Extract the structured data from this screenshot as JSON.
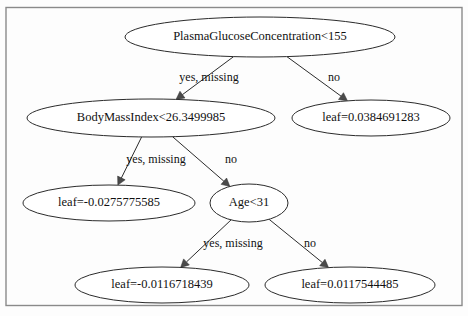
{
  "diagram": {
    "type": "decision-tree",
    "title": "",
    "frame_color": "#8a8a8a",
    "node_stroke_color": "#2b2b2b",
    "background_color": "#fdfdfd",
    "nodes": [
      {
        "id": "n0",
        "label": "PlasmaGlucoseConcentration<155",
        "kind": "split",
        "cx": 260,
        "cy": 37,
        "rx": 135,
        "ry": 20
      },
      {
        "id": "n1",
        "label": "BodyMassIndex<26.3499985",
        "kind": "split",
        "cx": 151,
        "cy": 118,
        "rx": 124,
        "ry": 19
      },
      {
        "id": "n2",
        "label": "leaf=0.0384691283",
        "kind": "leaf",
        "cx": 371,
        "cy": 118,
        "rx": 79,
        "ry": 18
      },
      {
        "id": "n3",
        "label": "leaf=-0.0275775585",
        "kind": "leaf",
        "cx": 109,
        "cy": 203,
        "rx": 86,
        "ry": 18
      },
      {
        "id": "n4",
        "label": "Age<31",
        "kind": "split",
        "cx": 249,
        "cy": 203,
        "rx": 39,
        "ry": 19
      },
      {
        "id": "n5",
        "label": "leaf=-0.0116718439",
        "kind": "leaf",
        "cx": 162,
        "cy": 285,
        "rx": 87,
        "ry": 18
      },
      {
        "id": "n6",
        "label": "leaf=0.0117544485",
        "kind": "leaf",
        "cx": 350,
        "cy": 285,
        "rx": 85,
        "ry": 18
      }
    ],
    "edges": [
      {
        "id": "e0",
        "from": "n0",
        "to": "n1",
        "label": "yes, missing",
        "label_x": 209,
        "label_y": 78
      },
      {
        "id": "e1",
        "from": "n0",
        "to": "n2",
        "label": "no",
        "label_x": 334,
        "label_y": 78
      },
      {
        "id": "e2",
        "from": "n1",
        "to": "n3",
        "label": "yes, missing",
        "label_x": 156,
        "label_y": 160
      },
      {
        "id": "e3",
        "from": "n1",
        "to": "n4",
        "label": "no",
        "label_x": 231,
        "label_y": 160
      },
      {
        "id": "e4",
        "from": "n4",
        "to": "n5",
        "label": "yes, missing",
        "label_x": 233,
        "label_y": 244
      },
      {
        "id": "e5",
        "from": "n4",
        "to": "n6",
        "label": "no",
        "label_x": 310,
        "label_y": 244
      }
    ]
  }
}
